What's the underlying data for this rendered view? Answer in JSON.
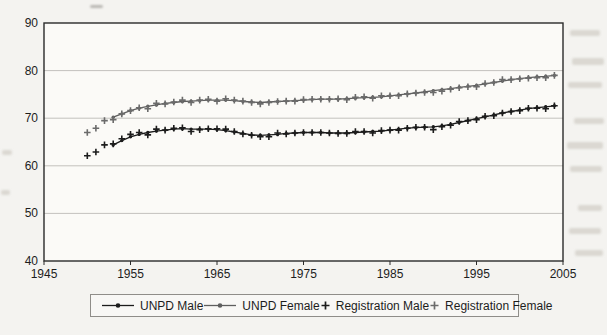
{
  "chart_data": {
    "type": "line",
    "title": "",
    "xlabel": "",
    "ylabel": "",
    "xlim": [
      1945,
      2005
    ],
    "ylim": [
      40,
      90
    ],
    "x_ticks": [
      1945,
      1955,
      1965,
      1975,
      1985,
      1995,
      2005
    ],
    "y_ticks": [
      40,
      50,
      60,
      70,
      80,
      90
    ],
    "grid": "horizontal",
    "legend_position": "bottom",
    "series": [
      {
        "name": "UNPD Male",
        "marker": "dot-line",
        "color": "#1c1c1c",
        "x": [
          1953,
          1954,
          1955,
          1956,
          1957,
          1958,
          1959,
          1960,
          1961,
          1962,
          1963,
          1964,
          1965,
          1966,
          1967,
          1968,
          1969,
          1970,
          1971,
          1972,
          1973,
          1974,
          1975,
          1976,
          1977,
          1978,
          1979,
          1980,
          1981,
          1982,
          1983,
          1984,
          1985,
          1986,
          1987,
          1988,
          1989,
          1990,
          1991,
          1992,
          1993,
          1994,
          1995,
          1996,
          1997,
          1998,
          1999,
          2000,
          2001,
          2002,
          2003,
          2004
        ],
        "y": [
          64.4,
          65.3,
          66.1,
          66.6,
          67.0,
          67.3,
          67.5,
          67.7,
          67.8,
          67.7,
          67.7,
          67.7,
          67.6,
          67.4,
          67.1,
          66.8,
          66.5,
          66.4,
          66.5,
          66.6,
          66.8,
          66.9,
          67.0,
          67.0,
          67.0,
          66.9,
          66.9,
          66.9,
          67.0,
          67.1,
          67.2,
          67.3,
          67.5,
          67.7,
          67.9,
          68.0,
          68.1,
          68.2,
          68.4,
          68.7,
          69.1,
          69.5,
          69.9,
          70.3,
          70.7,
          71.1,
          71.4,
          71.7,
          72.0,
          72.2,
          72.4,
          72.6
        ]
      },
      {
        "name": "UNPD Female",
        "marker": "dot-line",
        "color": "#5e5e5e",
        "x": [
          1953,
          1954,
          1955,
          1956,
          1957,
          1958,
          1959,
          1960,
          1961,
          1962,
          1963,
          1964,
          1965,
          1966,
          1967,
          1968,
          1969,
          1970,
          1971,
          1972,
          1973,
          1974,
          1975,
          1976,
          1977,
          1978,
          1979,
          1980,
          1981,
          1982,
          1983,
          1984,
          1985,
          1986,
          1987,
          1988,
          1989,
          1990,
          1991,
          1992,
          1993,
          1994,
          1995,
          1996,
          1997,
          1998,
          1999,
          2000,
          2001,
          2002,
          2003,
          2004
        ],
        "y": [
          70.2,
          70.9,
          71.6,
          72.1,
          72.5,
          72.8,
          73.1,
          73.3,
          73.5,
          73.6,
          73.7,
          73.8,
          73.8,
          73.8,
          73.7,
          73.5,
          73.4,
          73.3,
          73.4,
          73.5,
          73.6,
          73.7,
          73.8,
          73.9,
          74.0,
          74.0,
          74.0,
          74.1,
          74.2,
          74.3,
          74.4,
          74.5,
          74.7,
          74.9,
          75.1,
          75.3,
          75.5,
          75.8,
          76.0,
          76.2,
          76.5,
          76.7,
          76.9,
          77.2,
          77.5,
          77.8,
          78.1,
          78.3,
          78.5,
          78.7,
          78.8,
          79.0
        ]
      },
      {
        "name": "Registration Male",
        "marker": "plus",
        "color": "#1c1c1c",
        "x": [
          1950,
          1951,
          1952,
          1953,
          1954,
          1955,
          1956,
          1957,
          1958,
          1959,
          1960,
          1961,
          1962,
          1963,
          1964,
          1965,
          1966,
          1967,
          1968,
          1969,
          1970,
          1971,
          1972,
          1973,
          1974,
          1975,
          1976,
          1977,
          1978,
          1979,
          1980,
          1981,
          1982,
          1983,
          1984,
          1985,
          1986,
          1987,
          1988,
          1989,
          1990,
          1991,
          1992,
          1993,
          1994,
          1995,
          1996,
          1997,
          1998,
          1999,
          2000,
          2001,
          2002,
          2003,
          2004
        ],
        "y": [
          62.1,
          62.9,
          64.4,
          64.6,
          65.7,
          66.6,
          67.0,
          66.5,
          67.7,
          67.5,
          67.9,
          68.0,
          67.2,
          67.6,
          67.8,
          67.8,
          67.7,
          67.2,
          66.7,
          66.4,
          66.1,
          66.1,
          66.9,
          66.7,
          66.9,
          67.0,
          67.0,
          67.0,
          66.9,
          66.8,
          66.8,
          67.2,
          67.2,
          66.9,
          67.4,
          67.5,
          67.5,
          67.9,
          68.1,
          68.1,
          67.6,
          68.2,
          68.5,
          69.3,
          69.5,
          69.7,
          70.4,
          70.5,
          71.1,
          71.4,
          71.6,
          72.1,
          72.1,
          72.0,
          72.6
        ]
      },
      {
        "name": "Registration Female",
        "marker": "plus",
        "color": "#6b6b6b",
        "x": [
          1950,
          1951,
          1952,
          1953,
          1954,
          1955,
          1956,
          1957,
          1958,
          1959,
          1960,
          1961,
          1962,
          1963,
          1964,
          1965,
          1966,
          1967,
          1968,
          1969,
          1970,
          1971,
          1972,
          1973,
          1974,
          1975,
          1976,
          1977,
          1978,
          1979,
          1980,
          1981,
          1982,
          1983,
          1984,
          1985,
          1986,
          1987,
          1988,
          1989,
          1990,
          1991,
          1992,
          1993,
          1994,
          1995,
          1996,
          1997,
          1998,
          1999,
          2000,
          2001,
          2002,
          2003,
          2004
        ],
        "y": [
          67.0,
          67.9,
          69.5,
          69.7,
          70.9,
          71.6,
          72.2,
          72.0,
          73.1,
          73.0,
          73.4,
          73.8,
          73.3,
          73.8,
          74.0,
          73.6,
          74.1,
          73.8,
          73.6,
          73.3,
          73.0,
          73.3,
          73.5,
          73.6,
          73.6,
          73.9,
          74.0,
          74.0,
          74.0,
          74.1,
          73.9,
          74.4,
          74.5,
          74.2,
          74.7,
          74.7,
          74.7,
          75.1,
          75.3,
          75.4,
          75.4,
          75.7,
          76.1,
          76.4,
          76.6,
          76.6,
          77.3,
          77.5,
          78.1,
          78.1,
          78.3,
          78.4,
          78.5,
          78.5,
          79.0
        ]
      }
    ]
  },
  "legend": {
    "items": [
      {
        "label": "UNPD Male"
      },
      {
        "label": "UNPD Female"
      },
      {
        "label": "Registration Male"
      },
      {
        "label": "Registration Female"
      }
    ]
  }
}
